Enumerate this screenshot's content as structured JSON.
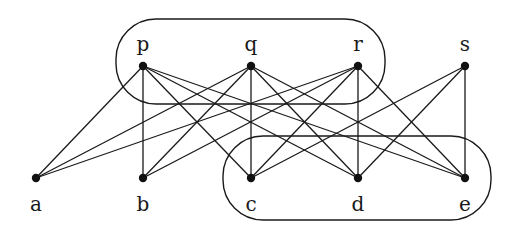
{
  "diagram": {
    "type": "bipartite-graph",
    "colors": {
      "stroke": "#1a1a1a",
      "node": "#111111",
      "background": "#ffffff"
    },
    "top_nodes": [
      {
        "id": "p",
        "label": "p",
        "x": 143,
        "y": 66
      },
      {
        "id": "q",
        "label": "q",
        "x": 251,
        "y": 66
      },
      {
        "id": "r",
        "label": "r",
        "x": 358,
        "y": 66
      },
      {
        "id": "s",
        "label": "s",
        "x": 465,
        "y": 66
      }
    ],
    "bottom_nodes": [
      {
        "id": "a",
        "label": "a",
        "x": 36,
        "y": 178
      },
      {
        "id": "b",
        "label": "b",
        "x": 143,
        "y": 178
      },
      {
        "id": "c",
        "label": "c",
        "x": 251,
        "y": 178
      },
      {
        "id": "d",
        "label": "d",
        "x": 358,
        "y": 178
      },
      {
        "id": "e",
        "label": "e",
        "x": 465,
        "y": 178
      }
    ],
    "edges": [
      [
        "p",
        "a"
      ],
      [
        "p",
        "b"
      ],
      [
        "p",
        "c"
      ],
      [
        "p",
        "d"
      ],
      [
        "p",
        "e"
      ],
      [
        "q",
        "a"
      ],
      [
        "q",
        "b"
      ],
      [
        "q",
        "c"
      ],
      [
        "q",
        "d"
      ],
      [
        "q",
        "e"
      ],
      [
        "r",
        "a"
      ],
      [
        "r",
        "b"
      ],
      [
        "r",
        "c"
      ],
      [
        "r",
        "d"
      ],
      [
        "r",
        "e"
      ],
      [
        "s",
        "c"
      ],
      [
        "s",
        "d"
      ],
      [
        "s",
        "e"
      ]
    ],
    "groups": [
      {
        "name": "top-group-pqr",
        "members": [
          "p",
          "q",
          "r"
        ],
        "x": 116,
        "y": 19,
        "w": 269,
        "h": 85,
        "rx": 40
      },
      {
        "name": "bottom-group-cde",
        "members": [
          "c",
          "d",
          "e"
        ],
        "x": 223,
        "y": 136,
        "w": 268,
        "h": 84,
        "rx": 40
      }
    ]
  }
}
